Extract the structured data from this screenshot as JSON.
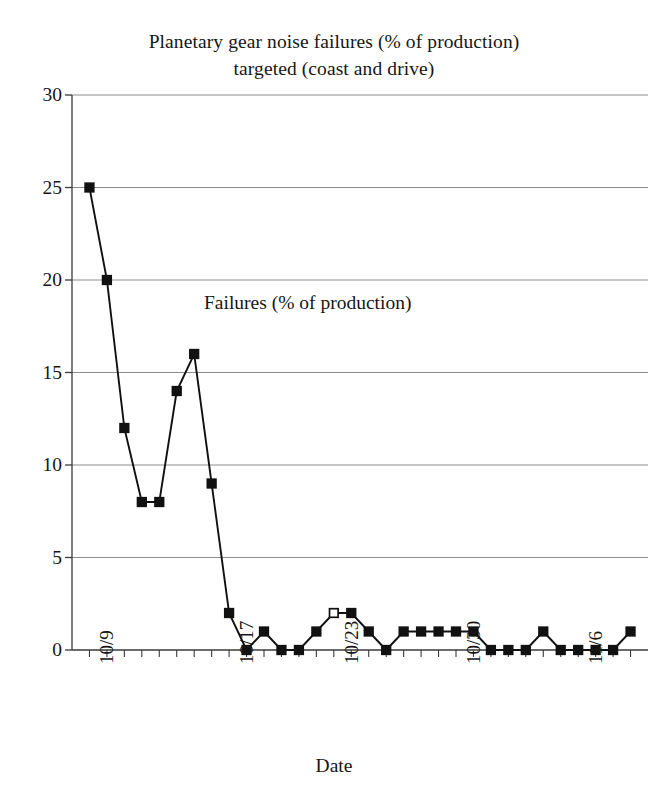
{
  "chart_data": {
    "type": "line",
    "title": "Planetary gear noise failures (% of production) targeted (coast and drive)",
    "title_lines": [
      "Planetary gear noise failures (% of production)",
      "targeted (coast and drive)"
    ],
    "annotation": "Failures (% of production)",
    "xlabel": "Date",
    "ylabel": "",
    "ylim": [
      0,
      30
    ],
    "yticks": [
      0,
      5,
      10,
      15,
      20,
      25,
      30
    ],
    "ytick_labels": [
      "0",
      "5",
      "10",
      "15",
      "20",
      "25",
      "30"
    ],
    "grid": "horizontal",
    "legend": "none",
    "marker": "square",
    "xtick_labels": [
      "10/9",
      "10/17",
      "10/23",
      "10/30",
      "11/6"
    ],
    "xtick_indices": [
      0,
      8,
      14,
      21,
      28
    ],
    "x": [
      0,
      1,
      2,
      3,
      4,
      5,
      6,
      7,
      8,
      9,
      10,
      11,
      12,
      13,
      14,
      15,
      16,
      17,
      18,
      19,
      20,
      21,
      22,
      23,
      24,
      25,
      26,
      27,
      28,
      29,
      30,
      31
    ],
    "values": [
      25,
      20,
      12,
      8,
      8,
      14,
      16,
      9,
      2,
      0,
      1,
      0,
      0,
      1,
      2,
      2,
      1,
      0,
      1,
      1,
      1,
      1,
      1,
      0,
      0,
      0,
      1,
      0,
      0,
      0,
      0,
      1
    ],
    "hollow_marker_indices": [
      14
    ],
    "series_name": "Failures (% of production)",
    "line_color": "#111111",
    "marker_color": "#111111",
    "grid_color": "#8d8d8d",
    "axis_color": "#3a3a3a",
    "background": "#ffffff"
  }
}
